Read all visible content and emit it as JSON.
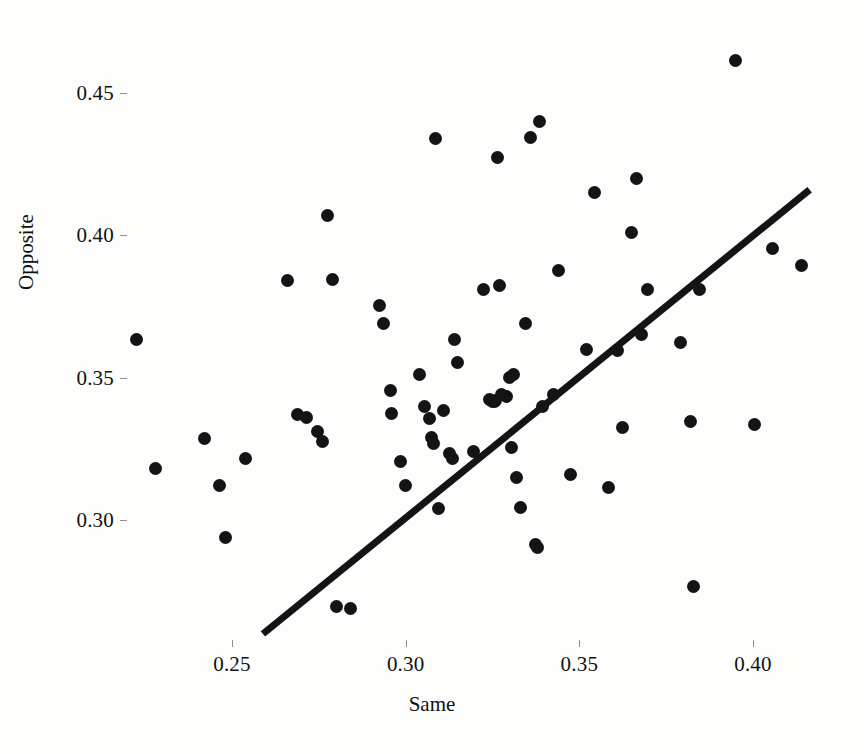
{
  "chart_data": {
    "type": "scatter",
    "title": "",
    "xlabel": "Same",
    "ylabel": "Opposite",
    "xlim": [
      0.218,
      0.421
    ],
    "ylim": [
      0.258,
      0.472
    ],
    "xticks": [
      0.25,
      0.3,
      0.35,
      0.4
    ],
    "xtick_labels": [
      "0.25",
      "0.30",
      "0.35",
      "0.40"
    ],
    "yticks": [
      0.3,
      0.35,
      0.4,
      0.45
    ],
    "ytick_labels": [
      "0.30",
      "0.35",
      "0.40",
      "0.45"
    ],
    "grid": false,
    "legend": null,
    "marker": "filled-circle",
    "marker_color": "#141414",
    "background_color": "#fdfdfc",
    "points": [
      [
        0.2225,
        0.3635
      ],
      [
        0.228,
        0.318
      ],
      [
        0.242,
        0.3285
      ],
      [
        0.2465,
        0.312
      ],
      [
        0.248,
        0.294
      ],
      [
        0.254,
        0.3215
      ],
      [
        0.266,
        0.384
      ],
      [
        0.269,
        0.337
      ],
      [
        0.2715,
        0.336
      ],
      [
        0.2745,
        0.331
      ],
      [
        0.276,
        0.3275
      ],
      [
        0.2775,
        0.407
      ],
      [
        0.279,
        0.3845
      ],
      [
        0.28,
        0.2695
      ],
      [
        0.284,
        0.269
      ],
      [
        0.2925,
        0.3755
      ],
      [
        0.2935,
        0.369
      ],
      [
        0.2955,
        0.3455
      ],
      [
        0.296,
        0.3375
      ],
      [
        0.2985,
        0.3205
      ],
      [
        0.3,
        0.312
      ],
      [
        0.304,
        0.351
      ],
      [
        0.3055,
        0.34
      ],
      [
        0.307,
        0.3355
      ],
      [
        0.3075,
        0.329
      ],
      [
        0.308,
        0.327
      ],
      [
        0.3085,
        0.434
      ],
      [
        0.3095,
        0.304
      ],
      [
        0.311,
        0.3385
      ],
      [
        0.3125,
        0.3235
      ],
      [
        0.3135,
        0.3215
      ],
      [
        0.314,
        0.3635
      ],
      [
        0.315,
        0.3555
      ],
      [
        0.3195,
        0.324
      ],
      [
        0.3225,
        0.381
      ],
      [
        0.324,
        0.3425
      ],
      [
        0.325,
        0.3415
      ],
      [
        0.3255,
        0.3415
      ],
      [
        0.326,
        0.342
      ],
      [
        0.3265,
        0.4275
      ],
      [
        0.327,
        0.3825
      ],
      [
        0.3275,
        0.344
      ],
      [
        0.329,
        0.3435
      ],
      [
        0.33,
        0.35
      ],
      [
        0.3305,
        0.3255
      ],
      [
        0.331,
        0.351
      ],
      [
        0.332,
        0.315
      ],
      [
        0.333,
        0.3045
      ],
      [
        0.3345,
        0.369
      ],
      [
        0.336,
        0.4345
      ],
      [
        0.3375,
        0.2915
      ],
      [
        0.338,
        0.2905
      ],
      [
        0.3385,
        0.44
      ],
      [
        0.3395,
        0.34
      ],
      [
        0.3425,
        0.344
      ],
      [
        0.344,
        0.3875
      ],
      [
        0.3475,
        0.316
      ],
      [
        0.352,
        0.36
      ],
      [
        0.3545,
        0.415
      ],
      [
        0.3585,
        0.3115
      ],
      [
        0.361,
        0.3595
      ],
      [
        0.3625,
        0.3325
      ],
      [
        0.365,
        0.401
      ],
      [
        0.3665,
        0.42
      ],
      [
        0.368,
        0.365
      ],
      [
        0.3695,
        0.381
      ],
      [
        0.379,
        0.3625
      ],
      [
        0.382,
        0.3345
      ],
      [
        0.383,
        0.2765
      ],
      [
        0.3845,
        0.381
      ],
      [
        0.395,
        0.4615
      ],
      [
        0.4005,
        0.3335
      ],
      [
        0.4055,
        0.3955
      ],
      [
        0.414,
        0.3895
      ]
    ],
    "trend_line": {
      "style": "solid",
      "color": "#141414",
      "width_px": 7,
      "x_start": 0.2589,
      "y_start": 0.26,
      "x_end": 0.4163,
      "y_end": 0.416
    }
  }
}
